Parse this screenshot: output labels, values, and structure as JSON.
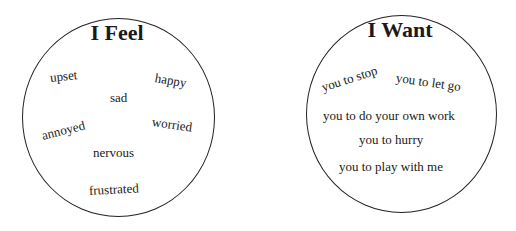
{
  "feel": {
    "title": "I Feel",
    "words": [
      {
        "text": "upset",
        "x": 50,
        "y": 70,
        "rot": -6
      },
      {
        "text": "happy",
        "x": 155,
        "y": 70,
        "rot": 10
      },
      {
        "text": "sad",
        "x": 110,
        "y": 90,
        "rot": 0
      },
      {
        "text": "annoyed",
        "x": 42,
        "y": 128,
        "rot": -14
      },
      {
        "text": "worried",
        "x": 152,
        "y": 114,
        "rot": 8
      },
      {
        "text": "nervous",
        "x": 93,
        "y": 145,
        "rot": 0
      },
      {
        "text": "frustrated",
        "x": 89,
        "y": 183,
        "rot": -3
      }
    ]
  },
  "want": {
    "title": "I Want",
    "words": [
      {
        "text": "you to stop",
        "x": 322,
        "y": 80,
        "rot": -18
      },
      {
        "text": "you to let go",
        "x": 396,
        "y": 70,
        "rot": 8
      },
      {
        "text": "you to do your own work",
        "x": 323,
        "y": 108,
        "rot": 0
      },
      {
        "text": "you to hurry",
        "x": 359,
        "y": 132,
        "rot": 0
      },
      {
        "text": "you to play with me",
        "x": 339,
        "y": 159,
        "rot": 0
      }
    ]
  }
}
